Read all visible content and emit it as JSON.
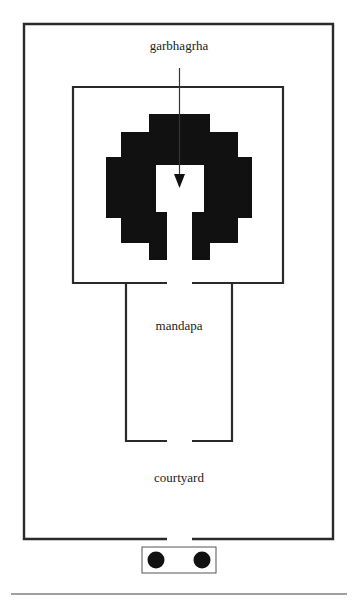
{
  "diagram": {
    "type": "temple-plan",
    "labels": {
      "garbhagrha": "garbhagrha",
      "mandapa": "mandapa",
      "courtyard": "courtyard"
    },
    "colors": {
      "line": "#2a2a2a",
      "fill": "#111111",
      "background": "#ffffff"
    },
    "elements": [
      {
        "name": "outer-enclosure",
        "label": "courtyard"
      },
      {
        "name": "sanctum-frame",
        "label": "garbhagrha"
      },
      {
        "name": "mandapa-hall",
        "label": "mandapa"
      },
      {
        "name": "entrance-porch",
        "pillars": 2
      }
    ],
    "arrow": {
      "from": "garbhagrha label",
      "to": "sanctum interior"
    }
  }
}
